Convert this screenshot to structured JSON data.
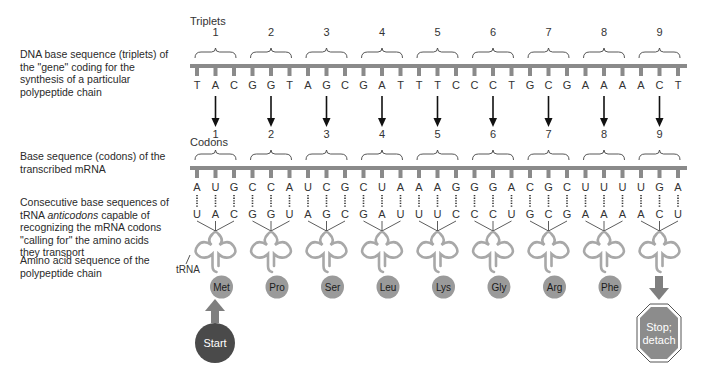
{
  "descriptions": {
    "dna": "DNA base sequence (triplets) of the \"gene\" coding for the synthesis of a particular polypeptide chain",
    "mrna": "Base sequence (codons) of the transcribed mRNA",
    "trna_pre": "Consecutive base sequences of tRNA ",
    "trna_em": "anticodons",
    "trna_post": " capable of recognizing the mRNA codons \"calling for\" the amino acids they transport",
    "aa": "Amino acid sequence of the polypeptide chain"
  },
  "labels": {
    "triplets": "Triplets",
    "codons": "Codons",
    "trna": "tRNA",
    "start": "Start",
    "stop_line1": "Stop;",
    "stop_line2": "detach"
  },
  "colors": {
    "strand": "#8a8a8a",
    "trna": "#a8a8a8",
    "amino_acid": "#9a9a9a",
    "arrow_gray": "#7f7f7f",
    "start_fill": "#4a4a4a",
    "stop_fill": "#8c8c8c"
  },
  "groups": [
    {
      "n": "1",
      "dna": [
        "T",
        "A",
        "C"
      ],
      "mrna": [
        "A",
        "U",
        "G"
      ],
      "anticodon": [
        "U",
        "A",
        "C"
      ],
      "aa": "Met"
    },
    {
      "n": "2",
      "dna": [
        "G",
        "G",
        "T"
      ],
      "mrna": [
        "C",
        "C",
        "A"
      ],
      "anticodon": [
        "G",
        "G",
        "U"
      ],
      "aa": "Pro"
    },
    {
      "n": "3",
      "dna": [
        "A",
        "G",
        "C"
      ],
      "mrna": [
        "U",
        "C",
        "G"
      ],
      "anticodon": [
        "A",
        "G",
        "C"
      ],
      "aa": "Ser"
    },
    {
      "n": "4",
      "dna": [
        "G",
        "A",
        "T"
      ],
      "mrna": [
        "C",
        "U",
        "A"
      ],
      "anticodon": [
        "G",
        "A",
        "U"
      ],
      "aa": "Leu"
    },
    {
      "n": "5",
      "dna": [
        "T",
        "T",
        "C"
      ],
      "mrna": [
        "A",
        "A",
        "G"
      ],
      "anticodon": [
        "U",
        "U",
        "C"
      ],
      "aa": "Lys"
    },
    {
      "n": "6",
      "dna": [
        "C",
        "C",
        "T"
      ],
      "mrna": [
        "G",
        "G",
        "A"
      ],
      "anticodon": [
        "C",
        "C",
        "U"
      ],
      "aa": "Gly"
    },
    {
      "n": "7",
      "dna": [
        "G",
        "C",
        "G"
      ],
      "mrna": [
        "C",
        "G",
        "C"
      ],
      "anticodon": [
        "G",
        "C",
        "G"
      ],
      "aa": "Arg"
    },
    {
      "n": "8",
      "dna": [
        "A",
        "A",
        "A"
      ],
      "mrna": [
        "U",
        "U",
        "U"
      ],
      "anticodon": [
        "A",
        "A",
        "A"
      ],
      "aa": "Phe"
    },
    {
      "n": "9",
      "dna": [
        "A",
        "C",
        "T"
      ],
      "mrna": [
        "U",
        "G",
        "A"
      ],
      "anticodon": [
        "A",
        "C",
        "U"
      ],
      "aa": ""
    }
  ]
}
